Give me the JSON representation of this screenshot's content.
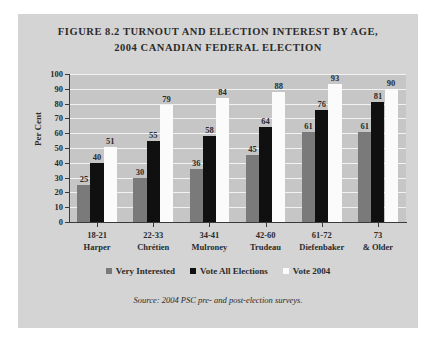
{
  "figure": {
    "title_line1": "FIGURE 8.2 TURNOUT AND ELECTION INTEREST BY AGE,",
    "title_line2": "2004 CANADIAN FEDERAL ELECTION",
    "source": "Source: 2004 PSC pre- and post-election surveys."
  },
  "chart_data": {
    "type": "bar",
    "title": "FIGURE 8.2 TURNOUT AND ELECTION INTEREST BY AGE, 2004 CANADIAN FEDERAL ELECTION",
    "xlabel": "",
    "ylabel": "Per Cent",
    "ylim": [
      0,
      100
    ],
    "ytick_step": 10,
    "yticks": [
      0,
      10,
      20,
      30,
      40,
      50,
      60,
      70,
      80,
      90,
      100
    ],
    "ytick_labels": [
      "0",
      "10",
      "20",
      "30",
      "40",
      "50",
      "60",
      "70",
      "80",
      "90",
      "100"
    ],
    "grid": true,
    "grid_axis": "y",
    "legend_position": "bottom",
    "categories": [
      "18-21",
      "22-33",
      "34-41",
      "42-60",
      "61-72",
      "73"
    ],
    "category_sublabels": [
      "Harper",
      "Chrétien",
      "Mulroney",
      "Trudeau",
      "Diefenbaker",
      "& Older"
    ],
    "series": [
      {
        "name": "Very Interested",
        "color": "#7a7a7a",
        "values": [
          25,
          30,
          36,
          45,
          61,
          61
        ]
      },
      {
        "name": "Vote All Elections",
        "color": "#101010",
        "values": [
          40,
          55,
          58,
          64,
          76,
          81
        ]
      },
      {
        "name": "Vote 2004",
        "color": "#fbfbfb",
        "values": [
          51,
          79,
          84,
          88,
          93,
          90
        ]
      }
    ],
    "source": "Source: 2004 PSC pre- and post-election surveys."
  },
  "colors": {
    "page_background": "#ffffff",
    "panel_background": "#d4d4d4",
    "plot_background": "#c6c6c6",
    "gridline": "#f2f2f2",
    "axis": "#3a3a3a",
    "text": "#2b2b2b"
  }
}
